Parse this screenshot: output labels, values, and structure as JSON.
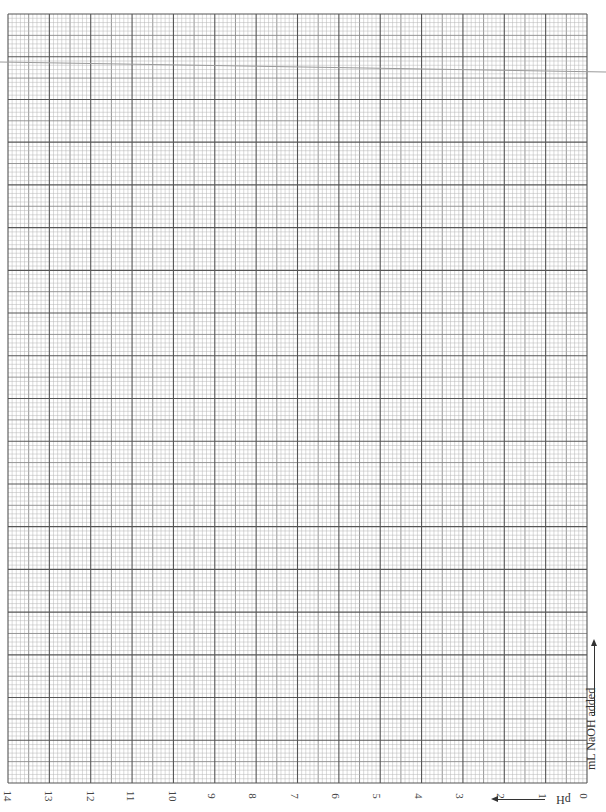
{
  "chart_data": {
    "type": "line",
    "title": "",
    "orientation_note": "page rotated 90°",
    "xlabel": "mL NaOH added",
    "ylabel": "pH",
    "y_ticks": [
      "14",
      "13",
      "12",
      "11",
      "10",
      "9",
      "8",
      "7",
      "6",
      "5",
      "4",
      "3",
      "2",
      "1",
      "0"
    ],
    "ylim": [
      0,
      14
    ],
    "grid": true,
    "series": [],
    "annotations": [
      "stray slanted line near top edge"
    ]
  },
  "labels": {
    "xlabel": "mL NaOH added",
    "ylabel": "pH"
  },
  "colors": {
    "major": "#555555",
    "mid": "#8a8a8a",
    "minor": "#b5b5b5",
    "stray": "#9a9a9a"
  }
}
